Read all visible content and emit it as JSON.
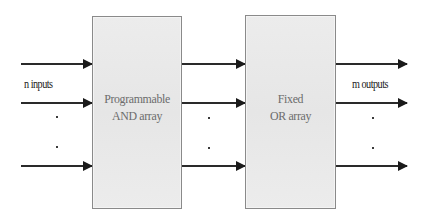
{
  "diagram": {
    "blocks": [
      {
        "id": "and-array",
        "line1": "Programmable",
        "line2": "AND array",
        "fill": "#e9e9e9",
        "border": "#8a8a8a"
      },
      {
        "id": "or-array",
        "line1": "Fixed",
        "line2": "OR array",
        "fill": "#e9e9e9",
        "border": "#8a8a8a"
      }
    ],
    "labels": {
      "inputs": "n inputs",
      "outputs": "m outputs"
    },
    "arrows": {
      "input_rows": 3,
      "between_rows": 3,
      "output_rows": 3,
      "color": "#1a1a1a"
    },
    "ellipsis_dots": {
      "inputs": [
        ".",
        "."
      ],
      "between": [
        ".",
        "."
      ],
      "outputs": [
        ".",
        "."
      ]
    }
  }
}
